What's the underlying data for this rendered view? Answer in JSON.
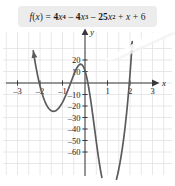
{
  "figure": {
    "equation_box": {
      "label": "f(x) = 4x^4 - 4x^3 - 25x^2 + x + 6",
      "fill": "#ececed",
      "parts": {
        "fname": "f",
        "open": "(",
        "var": "x",
        "close": ")",
        "equals": "=",
        "t1_coef": "4",
        "t1_var": "x",
        "t1_exp": "4",
        "op1": "–",
        "t2_coef": "4",
        "t2_var": "x",
        "t2_exp": "3",
        "op2": "–",
        "t3_coef": "25",
        "t3_var": "x",
        "t3_exp": "2",
        "op3": "+",
        "t4_var": "x",
        "op4": "+",
        "t5_const": "6"
      }
    },
    "axis_labels": {
      "x": "x",
      "y": "y"
    },
    "colors": {
      "curve": "#5b5b5e",
      "axis": "#39393b",
      "grid": "#e2e2e5",
      "text": "#1b1b1b",
      "box": "#ececed",
      "background": "#ffffff"
    }
  },
  "chart_data": {
    "type": "line",
    "xlabel": "x",
    "ylabel": "y",
    "xlim": [
      -3.6,
      3.7
    ],
    "ylim": [
      -68,
      28
    ],
    "grid": true,
    "legend": "none",
    "x_ticks": [
      -3,
      -2,
      -1,
      1,
      2,
      3
    ],
    "x_tick_labels": [
      "–3",
      "–2",
      "–1",
      "1",
      "2",
      "3"
    ],
    "y_ticks": [
      20,
      10,
      -10,
      -20,
      -30,
      -40,
      -50,
      -60
    ],
    "y_tick_labels": [
      "20",
      "10",
      "–10",
      "–20",
      "–30",
      "–40",
      "–50",
      "–60"
    ],
    "grid_step_x": 0.5,
    "grid_step_y": 10,
    "function": "4*x^4 - 4*x^3 - 25*x^2 + x + 6",
    "series": [
      {
        "name": "f(x)",
        "x": [
          -2.3,
          -2.25,
          -2.2,
          -2.15,
          -2.1,
          -2.05,
          -2.0,
          -1.95,
          -1.9,
          -1.85,
          -1.8,
          -1.75,
          -1.7,
          -1.65,
          -1.6,
          -1.55,
          -1.5,
          -1.45,
          -1.4,
          -1.35,
          -1.3,
          -1.25,
          -1.2,
          -1.15,
          -1.1,
          -1.05,
          -1.0,
          -0.95,
          -0.9,
          -0.85,
          -0.8,
          -0.75,
          -0.7,
          -0.65,
          -0.6,
          -0.55,
          -0.5,
          -0.45,
          -0.4,
          -0.35,
          -0.3,
          -0.25,
          -0.2,
          -0.15,
          -0.1,
          -0.05,
          0.0,
          0.05,
          0.1,
          0.15,
          0.2,
          0.25,
          0.3,
          0.35,
          0.4,
          0.45,
          0.5,
          0.55,
          0.6,
          0.65,
          0.7,
          0.75,
          0.8,
          0.85,
          0.9,
          0.95,
          1.0,
          1.05,
          1.1,
          1.15,
          1.2,
          1.25,
          1.3,
          1.35,
          1.4,
          1.45,
          1.5,
          1.55,
          1.6,
          1.65,
          1.7,
          1.75,
          1.8,
          1.85,
          1.9,
          1.95,
          2.0,
          2.05,
          2.1,
          2.15,
          2.2,
          2.25,
          2.3,
          2.35,
          2.4,
          2.45,
          2.5,
          2.55,
          2.6,
          2.65,
          2.7,
          2.75,
          2.8,
          2.85,
          2.9,
          2.95,
          3.0,
          3.05,
          3.1
        ],
        "y": [
          28.0,
          21.9,
          16.2,
          10.9,
          6.0,
          1.5,
          -2.6,
          -6.3,
          -9.6,
          -12.6,
          -15.2,
          -17.5,
          -19.5,
          -21.1,
          -22.4,
          -23.4,
          -24.1,
          -24.5,
          -24.6,
          -24.5,
          -24.1,
          -23.4,
          -22.5,
          -21.4,
          -20.1,
          -18.5,
          -16.8,
          -14.9,
          -12.8,
          -10.6,
          -8.2,
          -5.8,
          -3.2,
          -0.6,
          2.0,
          4.6,
          7.1,
          9.5,
          11.7,
          13.5,
          15.0,
          16.0,
          16.4,
          16.1,
          15.1,
          13.3,
          10.6,
          7.1,
          2.8,
          -2.3,
          -8.1,
          -14.5,
          -21.4,
          -28.6,
          -36.0,
          -43.4,
          -50.8,
          -58.0,
          -64.8,
          -71.2,
          -77.0,
          -82.1,
          -86.5,
          -90.2,
          -93.1,
          -95.2,
          -96.5,
          -97.1,
          -97.0,
          -96.2,
          -94.8,
          -92.8,
          -90.3,
          -87.3,
          -83.7,
          -79.6,
          -75.0,
          -69.9,
          -64.2,
          -58.0,
          -51.1,
          -43.5,
          -35.2,
          -26.0,
          -15.9,
          -4.8,
          7.5,
          21.1,
          36.1,
          52.6,
          70.8,
          90.9,
          113.0,
          137.2,
          163.7,
          192.7,
          224.4,
          258.9,
          296.4,
          337.1,
          381.2,
          428.9,
          480.5,
          536.2,
          596.3,
          661.0,
          730.6,
          805.4,
          885.6
        ]
      }
    ],
    "visible_features": {
      "left_minimum": {
        "x": -1.4,
        "y": -24.6
      },
      "local_maximum": {
        "x": -0.2,
        "y": 16.4
      },
      "right_minimum": {
        "x": 2.3,
        "y": -62
      },
      "x_intercepts": [
        "−2",
        "−0.5 approx",
        "0.2 approx",
        "2.9 approx"
      ],
      "arrow_ends": [
        "upper-left",
        "upper-right"
      ]
    }
  }
}
